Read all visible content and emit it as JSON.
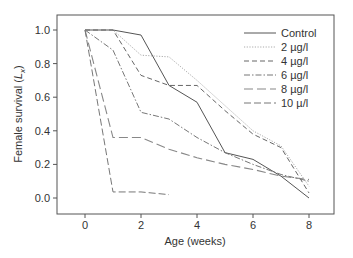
{
  "chart_data": {
    "type": "line",
    "title": "",
    "xlabel": "Age (weeks)",
    "ylabel": "Female survival (Lx)",
    "ylabel_main": "Female survival (",
    "ylabel_italic": "L",
    "ylabel_sub": "x",
    "ylabel_close": ")",
    "xlim": [
      -1,
      9
    ],
    "ylim": [
      -0.1,
      1.1
    ],
    "xticks": [
      0,
      2,
      4,
      6,
      8
    ],
    "yticks": [
      "0.0",
      "0.2",
      "0.4",
      "0.6",
      "0.8",
      "1.0"
    ],
    "grid": false,
    "legend_position": "upper right",
    "series": [
      {
        "name": "Control",
        "style": "solid",
        "x": [
          0,
          1,
          2,
          3,
          4,
          5,
          6,
          7,
          8
        ],
        "values": [
          1.0,
          1.0,
          0.97,
          0.67,
          0.57,
          0.27,
          0.23,
          0.13,
          0.0
        ]
      },
      {
        "name": "2 µg/l",
        "style": "dotted",
        "x": [
          0,
          1,
          2,
          3,
          4,
          5,
          6,
          7,
          8
        ],
        "values": [
          1.0,
          1.0,
          0.85,
          0.84,
          0.7,
          0.55,
          0.4,
          0.31,
          0.07
        ]
      },
      {
        "name": "4 µg/l",
        "style": "dashed",
        "x": [
          0,
          1,
          2,
          3,
          4,
          5,
          6,
          7,
          8
        ],
        "values": [
          1.0,
          1.0,
          0.73,
          0.67,
          0.67,
          0.52,
          0.38,
          0.3,
          0.03
        ]
      },
      {
        "name": "6 µg/l",
        "style": "dashdot",
        "x": [
          0,
          1,
          2,
          3,
          4,
          5,
          6,
          7,
          8
        ],
        "values": [
          1.0,
          0.88,
          0.51,
          0.47,
          0.36,
          0.27,
          0.2,
          0.14,
          0.1
        ]
      },
      {
        "name": "8 µg/l",
        "style": "longdash",
        "x": [
          0,
          1,
          2,
          3,
          4,
          5,
          6,
          7,
          8
        ],
        "values": [
          1.0,
          0.36,
          0.36,
          0.29,
          0.24,
          0.2,
          0.17,
          0.13,
          0.11
        ]
      },
      {
        "name": "10 µ/l",
        "style": "dashed2",
        "x": [
          0,
          1,
          2,
          3
        ],
        "values": [
          1.0,
          0.036,
          0.036,
          0.02
        ]
      }
    ]
  },
  "colors": {
    "line": "#555555",
    "axis": "#555555",
    "dotted": "#999999"
  }
}
